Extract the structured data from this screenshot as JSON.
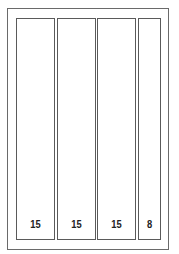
{
  "diagram": {
    "panels": [
      {
        "label": "15"
      },
      {
        "label": "15"
      },
      {
        "label": "15"
      },
      {
        "label": "8"
      }
    ]
  }
}
